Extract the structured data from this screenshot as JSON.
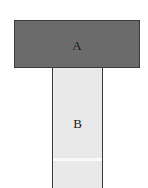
{
  "diagram": {
    "type": "t-shape-two-part-figure",
    "background_color": "#ffffff",
    "outline_color": "#3c3c3c",
    "label_color": "#1a1a1a",
    "parts": [
      {
        "id": "A",
        "label": "A",
        "role": "horizontal-top-bar",
        "fill_color": "#6b6b6b",
        "x": 14,
        "y": 20,
        "width": 126,
        "height": 48
      },
      {
        "id": "B",
        "label": "B",
        "role": "vertical-stem-bar",
        "fill_color": "#e9e9e9",
        "x": 52,
        "y": 67,
        "width": 51,
        "height": 121
      }
    ],
    "seam": {
      "name": "stem-seam",
      "color": "#fafafa",
      "y": 158
    }
  }
}
